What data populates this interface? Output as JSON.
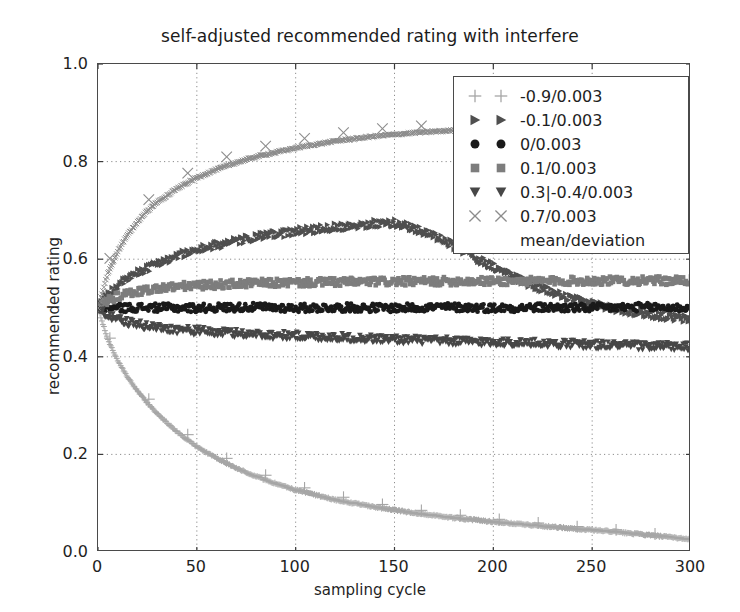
{
  "chart_data": {
    "type": "scatter",
    "title": "self-adjusted recommended rating with interfere",
    "xlabel": "sampling cycle",
    "ylabel": "recommended rating",
    "xlim": [
      0,
      300
    ],
    "ylim": [
      0.0,
      1.0
    ],
    "xticks": [
      0,
      50,
      100,
      150,
      200,
      250,
      300
    ],
    "xtick_labels": [
      "0",
      "50",
      "100",
      "150",
      "200",
      "250",
      "300"
    ],
    "yticks": [
      0.0,
      0.2,
      0.4,
      0.6,
      0.8,
      1.0
    ],
    "ytick_labels": [
      "0.0",
      "0.2",
      "0.4",
      "0.6",
      "0.8",
      "1.0"
    ],
    "grid": true,
    "grid_style": "dotted",
    "legend_position": "upper right",
    "legend_note": "mean/deviation",
    "noise_deviation": 0.003,
    "series": [
      {
        "name": "-0.9/0.003",
        "marker": "plus",
        "color": "#a6a6a6",
        "x": [
          0,
          5,
          10,
          15,
          20,
          25,
          30,
          40,
          50,
          60,
          70,
          80,
          90,
          100,
          120,
          140,
          160,
          180,
          200,
          220,
          240,
          260,
          280,
          300
        ],
        "values": [
          0.5,
          0.435,
          0.392,
          0.358,
          0.33,
          0.305,
          0.283,
          0.246,
          0.216,
          0.192,
          0.172,
          0.155,
          0.14,
          0.127,
          0.107,
          0.092,
          0.08,
          0.07,
          0.062,
          0.055,
          0.048,
          0.042,
          0.034,
          0.026
        ]
      },
      {
        "name": "-0.1/0.003",
        "marker": "triangle-right",
        "color": "#4f4f4f",
        "x": [
          0,
          5,
          10,
          20,
          30,
          40,
          50,
          60,
          80,
          100,
          120,
          140,
          150,
          160,
          170,
          180,
          190,
          200,
          220,
          240,
          260,
          280,
          300
        ],
        "values": [
          0.5,
          0.527,
          0.546,
          0.572,
          0.592,
          0.607,
          0.619,
          0.629,
          0.645,
          0.657,
          0.666,
          0.673,
          0.674,
          0.664,
          0.648,
          0.628,
          0.606,
          0.585,
          0.546,
          0.518,
          0.5,
          0.487,
          0.476
        ]
      },
      {
        "name": "0/0.003",
        "marker": "circle",
        "color": "#1a1a1a",
        "x": [
          0,
          25,
          50,
          75,
          100,
          125,
          150,
          175,
          200,
          225,
          250,
          275,
          300
        ],
        "values": [
          0.5,
          0.501,
          0.5,
          0.502,
          0.5,
          0.501,
          0.5,
          0.502,
          0.5,
          0.501,
          0.5,
          0.502,
          0.5
        ]
      },
      {
        "name": "0.1/0.003",
        "marker": "square",
        "color": "#7d7d7d",
        "x": [
          0,
          5,
          10,
          20,
          30,
          40,
          60,
          80,
          100,
          140,
          180,
          220,
          260,
          300
        ],
        "values": [
          0.5,
          0.515,
          0.524,
          0.534,
          0.54,
          0.544,
          0.548,
          0.551,
          0.552,
          0.554,
          0.555,
          0.555,
          0.556,
          0.556
        ]
      },
      {
        "name": "0.3|-0.4/0.003",
        "marker": "triangle-down",
        "color": "#474747",
        "x": [
          0,
          5,
          10,
          20,
          30,
          40,
          60,
          80,
          100,
          140,
          180,
          220,
          260,
          300
        ],
        "values": [
          0.5,
          0.484,
          0.476,
          0.466,
          0.46,
          0.456,
          0.45,
          0.446,
          0.443,
          0.437,
          0.432,
          0.428,
          0.424,
          0.42
        ]
      },
      {
        "name": "0.7/0.003",
        "marker": "x",
        "color": "#8c8c8c",
        "x": [
          0,
          5,
          10,
          15,
          20,
          25,
          30,
          40,
          50,
          60,
          70,
          80,
          100,
          120,
          140,
          160,
          200,
          240,
          280,
          300
        ],
        "values": [
          0.5,
          0.571,
          0.616,
          0.65,
          0.677,
          0.699,
          0.717,
          0.745,
          0.767,
          0.784,
          0.798,
          0.81,
          0.828,
          0.842,
          0.852,
          0.859,
          0.869,
          0.876,
          0.882,
          0.885
        ]
      }
    ]
  }
}
